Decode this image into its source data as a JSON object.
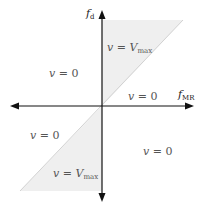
{
  "diagram": {
    "type": "quadrant-region-diagram",
    "axes": {
      "horizontal": {
        "label_base": "f",
        "label_sub": "MR"
      },
      "vertical": {
        "label_base": "f",
        "label_sub": "d"
      }
    },
    "regions": [
      {
        "id": "upper-shaded",
        "var": "v",
        "eq": " = ",
        "val_base": "V",
        "val_sub": "max",
        "shaded": true
      },
      {
        "id": "upper-left",
        "var": "v",
        "eq": " = ",
        "val": "0",
        "shaded": false
      },
      {
        "id": "upper-right-below-diagonal",
        "var": "v",
        "eq": " = ",
        "val": "0",
        "shaded": false
      },
      {
        "id": "lower-left-above-diagonal",
        "var": "v",
        "eq": " = ",
        "val": "0",
        "shaded": false
      },
      {
        "id": "lower-right",
        "var": "v",
        "eq": " = ",
        "val": "0",
        "shaded": false
      },
      {
        "id": "lower-shaded",
        "var": "v",
        "eq": " = ",
        "val_base": "V",
        "val_sub": "max",
        "shaded": true
      }
    ],
    "colors": {
      "axis": "#111111",
      "shade": "#eeeeee",
      "diagonal": "#cfcfcf",
      "text": "#555555"
    }
  }
}
